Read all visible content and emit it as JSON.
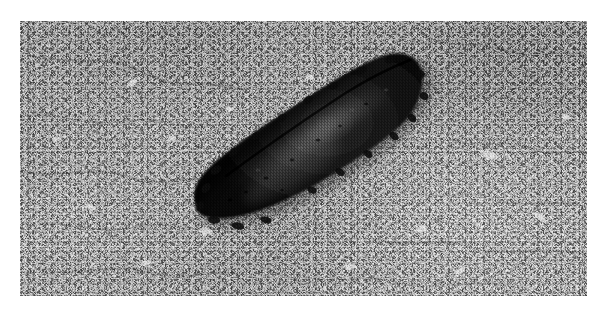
{
  "page": {
    "background_color": "#ffffff",
    "width": 608,
    "height": 317,
    "type": "photograph"
  },
  "photo": {
    "label": "Black and white photograph",
    "frame": {
      "left": 20,
      "top": 21,
      "width": 567,
      "height": 275,
      "margin_color": "#ffffff"
    },
    "mode": "grayscale",
    "scene_description": "A dark elongated sea cucumber resting on a coarse granular light-grey rocky seabed",
    "background": {
      "name": "rocky-substrate",
      "description": "Coarse mottled granular rock and sand surface with dark speckles and pale pebbles",
      "light_tone": "#c6c6c6",
      "mid_tone": "#ababab",
      "dark_tone": "#4d4d4d",
      "highlight_tone": "#e8e8e8"
    },
    "subject": {
      "name": "sea-cucumber",
      "description": "Dark elongated curved body oriented lower-left to upper-right",
      "body_color": "#141414",
      "shadow_color": "#0a0a0a",
      "highlight_color": "#5d5d5d",
      "orientation": "diagonal-lower-left-to-upper-right",
      "bounds": {
        "left": 212,
        "top": 74,
        "right": 430,
        "bottom": 236
      }
    }
  }
}
